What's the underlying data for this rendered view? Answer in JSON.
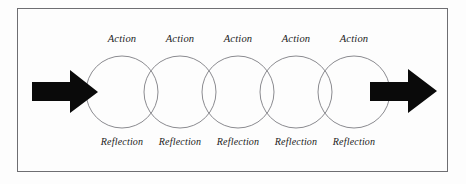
{
  "figure": {
    "type": "cycle-diagram",
    "frame": {
      "border_color": "#6e6e72",
      "background_color": "#fdfdfd"
    },
    "circle_style": {
      "stroke_color": "#8b8b90",
      "fill": "none",
      "count": 5,
      "radius": 36
    },
    "arrow_style": {
      "color": "#0a0a0a",
      "direction": "right"
    },
    "arrows": [
      {
        "name": "input-arrow",
        "position": "left",
        "direction": "right"
      },
      {
        "name": "output-arrow",
        "position": "right",
        "direction": "right"
      }
    ],
    "cycles": [
      {
        "action": "Action",
        "reflection": "Reflection"
      },
      {
        "action": "Action",
        "reflection": "Reflection"
      },
      {
        "action": "Action",
        "reflection": "Reflection"
      },
      {
        "action": "Action",
        "reflection": "Reflection"
      },
      {
        "action": "Action",
        "reflection": "Reflection"
      }
    ]
  }
}
